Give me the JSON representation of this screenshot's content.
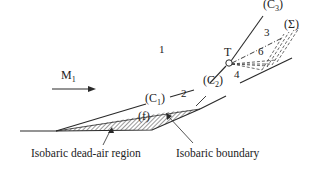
{
  "diagram": {
    "freestream_label": "M",
    "freestream_sub": "1",
    "regions": {
      "r1": "1",
      "r2": "2",
      "r3": "3",
      "r4": "4",
      "r6": "6"
    },
    "shocks": {
      "c1": "(C",
      "c1_sub": "1",
      "c1_close": ")",
      "c2": "(C",
      "c2_sub": "2",
      "c2_close": ")",
      "c3": "(C",
      "c3_sub": "3",
      "c3_close": ")",
      "sigma": "(Σ)",
      "f": "(f)"
    },
    "point_T": "T",
    "captions": {
      "dead_air": "Isobaric dead-air region",
      "boundary": "Isobaric boundary"
    },
    "colors": {
      "line": "#2a2a2a",
      "hatch": "#555555"
    }
  }
}
